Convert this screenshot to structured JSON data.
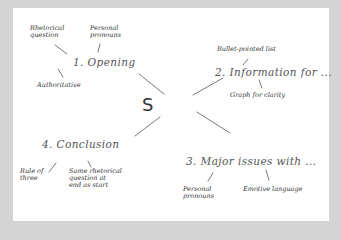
{
  "mind_map": {
    "center": "S",
    "branches": [
      {
        "label": "1. Opening",
        "children": [
          "Rhetorical question",
          "Personal pronouns",
          "Authoritative"
        ]
      },
      {
        "label": "2. Information for ...",
        "children": [
          "Bullet-pointed list",
          "Graph for clarity"
        ]
      },
      {
        "label": "3. Major issues with ...",
        "children": [
          "Personal pronouns",
          "Emotive language"
        ]
      },
      {
        "label": "4. Conclusion",
        "children": [
          "Rule of three",
          "Same rhetorical question at end as start"
        ]
      }
    ]
  },
  "leaf_text": {
    "b1_rq_l1": "Rhetorical",
    "b1_rq_l2": "question",
    "b1_pp_l1": "Personal",
    "b1_pp_l2": "pronouns",
    "b1_auth": "Authoritative",
    "b2_bullet": "Bullet-pointed list",
    "b2_graph": "Graph for clarity",
    "b3_pp_l1": "Personal",
    "b3_pp_l2": "pronouns",
    "b3_emotive": "Emotive language",
    "b4_rule_l1": "Rule of",
    "b4_rule_l2": "three",
    "b4_same_l1": "Same rhetorical",
    "b4_same_l2": "question at",
    "b4_same_l3": "end as start"
  },
  "colors": {
    "frame": "#d4d4d4",
    "canvas": "#ffffff",
    "ink": "#555555"
  }
}
